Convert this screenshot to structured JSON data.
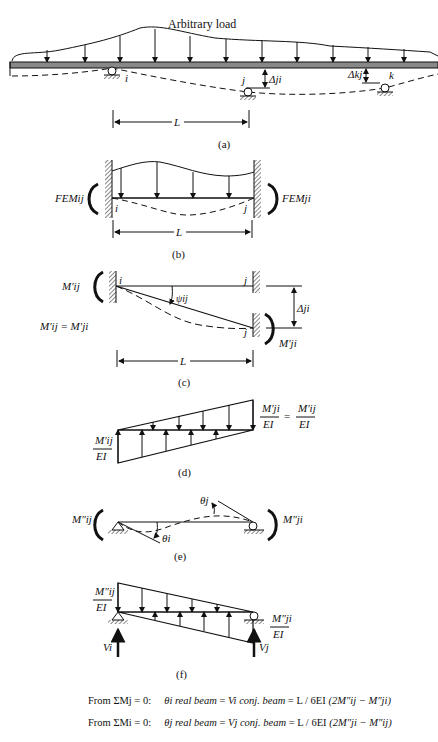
{
  "figure": {
    "a": {
      "caption": "(a)",
      "load_label": "Arbitrary load",
      "support_labels": [
        "i",
        "j",
        "k"
      ],
      "deflection_labels": [
        "Δji",
        "Δkj"
      ],
      "span_label": "L"
    },
    "b": {
      "caption": "(b)",
      "moment_left": "FEMij",
      "moment_right": "FEMji",
      "end_labels": [
        "i",
        "j"
      ],
      "span_label": "L"
    },
    "c": {
      "caption": "(c)",
      "moment_left": "M′ij",
      "moment_right": "M′ji",
      "relation": "M′ij = M′ji",
      "rotation_label": "ψij",
      "deflection_label": "Δji",
      "end_labels": [
        "i",
        "j",
        "j"
      ],
      "span_label": "L"
    },
    "d": {
      "caption": "(d)",
      "left_label_num": "M′ij",
      "left_label_den": "EI",
      "right_label_num": "M′ji",
      "right_label_den": "EI",
      "right_equals_num": "M′ij",
      "right_equals_den": "EI"
    },
    "e": {
      "caption": "(e)",
      "moment_left": "M″ij",
      "moment_right": "M″ji",
      "theta_i": "θi",
      "theta_j": "θj"
    },
    "f": {
      "caption": "(f)",
      "left_label_num": "M″ij",
      "left_label_den": "EI",
      "right_label_num": "M″ji",
      "right_label_den": "EI",
      "reaction_left": "Vi",
      "reaction_right": "Vj"
    }
  },
  "equations": [
    {
      "condition": "From ΣMj = 0:",
      "lhs": "θi real beam",
      "mid": "Vi conj. beam",
      "coef": "L / 6EI",
      "rhs": "(2M″ij − M″ji)"
    },
    {
      "condition": "From ΣMi = 0:",
      "lhs": "θj real beam",
      "mid": "Vj conj. beam",
      "coef": "L / 6EI",
      "rhs": "(2M″ji − M″ij)"
    }
  ]
}
